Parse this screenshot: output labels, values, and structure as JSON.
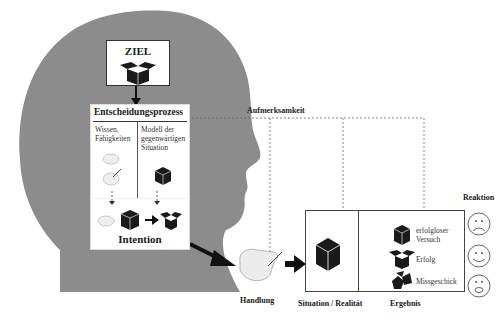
{
  "colors": {
    "head": "#8c8c8c",
    "box_border": "#555555",
    "dashed": "#666666",
    "icon": "#1a1a1a",
    "hand": "#e8e8e8"
  },
  "head": {
    "goal_box": {
      "title": "ZIEL",
      "icon": "open-box-icon"
    },
    "decision_box": {
      "title": "Entscheidungsprozess",
      "left_column": {
        "label": "Wissen, Fähigkeiten",
        "icons": [
          "hand-icon",
          "hand-with-pen-icon"
        ]
      },
      "right_column": {
        "label": "Modell der gegenwärtigen Situation",
        "icons": [
          "closed-box-icon"
        ]
      },
      "intention": {
        "label": "Intention",
        "icons": [
          "hand-icon",
          "closed-box-icon",
          "arrow-right-icon",
          "open-box-icon"
        ]
      }
    }
  },
  "attention": {
    "label": "Aufmerksamkeit"
  },
  "action": {
    "label": "Handlung",
    "icon": "hand-icon"
  },
  "situation_box": {
    "situation_label": "Situation / Realität",
    "result_label": "Ergebnis",
    "outcomes": [
      {
        "label_line1": "erfolgloser",
        "label_line2": "Versuch",
        "icon": "closed-box-icon",
        "reaction": "sad-face-icon"
      },
      {
        "label_line1": "Erfolg",
        "label_line2": "",
        "icon": "open-box-icon",
        "reaction": "happy-face-icon"
      },
      {
        "label_line1": "Missgeschick",
        "label_line2": "",
        "icon": "broken-box-icon",
        "reaction": "shocked-face-icon"
      }
    ]
  },
  "reaction": {
    "label": "Reaktion"
  }
}
